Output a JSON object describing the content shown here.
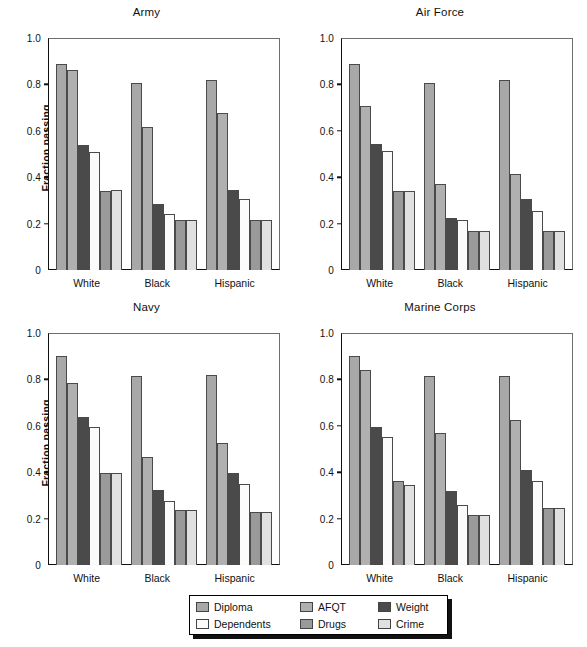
{
  "figure": {
    "ylabel": "Fraction passing",
    "ytick_labels": [
      "1.0",
      "0.8",
      "0.6",
      "0.4",
      "0.2",
      "0"
    ],
    "ytick_values": [
      1.0,
      0.8,
      0.6,
      0.4,
      0.2,
      0
    ],
    "categories": [
      "White",
      "Black",
      "Hispanic"
    ]
  },
  "legend": {
    "items": [
      {
        "label": "Diploma",
        "color": "#a8a8a8"
      },
      {
        "label": "Dependents",
        "color": "#fbfbfb"
      },
      {
        "label": "AFQT",
        "color": "#b0b0b0"
      },
      {
        "label": "Drugs",
        "color": "#9a9a9a"
      },
      {
        "label": "Weight",
        "color": "#4a4a4a"
      },
      {
        "label": "Crime",
        "color": "#e0e0e0"
      }
    ]
  },
  "chart_data": [
    {
      "type": "bar",
      "title": "Army",
      "xlabel": "",
      "ylabel": "Fraction passing",
      "ylim": [
        0,
        1.0
      ],
      "grid": false,
      "legend_position": "bottom-center-shared",
      "categories": [
        "White",
        "Black",
        "Hispanic"
      ],
      "series": [
        {
          "name": "Diploma",
          "color": "#a8a8a8",
          "values": [
            0.89,
            0.805,
            0.82
          ]
        },
        {
          "name": "AFQT",
          "color": "#b0b0b0",
          "values": [
            0.86,
            0.615,
            0.675
          ]
        },
        {
          "name": "Weight",
          "color": "#4a4a4a",
          "values": [
            0.54,
            0.285,
            0.345
          ]
        },
        {
          "name": "Dependents",
          "color": "#fbfbfb",
          "values": [
            0.51,
            0.24,
            0.305
          ]
        },
        {
          "name": "Drugs",
          "color": "#9a9a9a",
          "values": [
            0.34,
            0.215,
            0.215
          ]
        },
        {
          "name": "Crime",
          "color": "#e0e0e0",
          "values": [
            0.345,
            0.215,
            0.215
          ]
        }
      ]
    },
    {
      "type": "bar",
      "title": "Air Force",
      "xlabel": "",
      "ylabel": "",
      "ylim": [
        0,
        1.0
      ],
      "grid": false,
      "legend_position": "bottom-center-shared",
      "categories": [
        "White",
        "Black",
        "Hispanic"
      ],
      "series": [
        {
          "name": "Diploma",
          "color": "#a8a8a8",
          "values": [
            0.89,
            0.805,
            0.82
          ]
        },
        {
          "name": "AFQT",
          "color": "#b0b0b0",
          "values": [
            0.705,
            0.37,
            0.415
          ]
        },
        {
          "name": "Weight",
          "color": "#4a4a4a",
          "values": [
            0.545,
            0.225,
            0.305
          ]
        },
        {
          "name": "Dependents",
          "color": "#fbfbfb",
          "values": [
            0.515,
            0.215,
            0.255
          ]
        },
        {
          "name": "Drugs",
          "color": "#9a9a9a",
          "values": [
            0.34,
            0.17,
            0.17
          ]
        },
        {
          "name": "Crime",
          "color": "#e0e0e0",
          "values": [
            0.34,
            0.17,
            0.17
          ]
        }
      ]
    },
    {
      "type": "bar",
      "title": "Navy",
      "xlabel": "",
      "ylabel": "Fraction passing",
      "ylim": [
        0,
        1.0
      ],
      "grid": false,
      "legend_position": "bottom-center-shared",
      "categories": [
        "White",
        "Black",
        "Hispanic"
      ],
      "series": [
        {
          "name": "Diploma",
          "color": "#a8a8a8",
          "values": [
            0.9,
            0.815,
            0.82
          ]
        },
        {
          "name": "AFQT",
          "color": "#b0b0b0",
          "values": [
            0.785,
            0.465,
            0.525
          ]
        },
        {
          "name": "Weight",
          "color": "#4a4a4a",
          "values": [
            0.64,
            0.325,
            0.395
          ]
        },
        {
          "name": "Dependents",
          "color": "#fbfbfb",
          "values": [
            0.595,
            0.275,
            0.35
          ]
        },
        {
          "name": "Drugs",
          "color": "#9a9a9a",
          "values": [
            0.395,
            0.235,
            0.23
          ]
        },
        {
          "name": "Crime",
          "color": "#e0e0e0",
          "values": [
            0.395,
            0.235,
            0.23
          ]
        }
      ]
    },
    {
      "type": "bar",
      "title": "Marine Corps",
      "xlabel": "",
      "ylabel": "",
      "ylim": [
        0,
        1.0
      ],
      "grid": false,
      "legend_position": "bottom-center-shared",
      "categories": [
        "White",
        "Black",
        "Hispanic"
      ],
      "series": [
        {
          "name": "Diploma",
          "color": "#a8a8a8",
          "values": [
            0.9,
            0.815,
            0.815
          ]
        },
        {
          "name": "AFQT",
          "color": "#b0b0b0",
          "values": [
            0.84,
            0.57,
            0.625
          ]
        },
        {
          "name": "Weight",
          "color": "#4a4a4a",
          "values": [
            0.595,
            0.32,
            0.41
          ]
        },
        {
          "name": "Dependents",
          "color": "#fbfbfb",
          "values": [
            0.55,
            0.26,
            0.36
          ]
        },
        {
          "name": "Drugs",
          "color": "#9a9a9a",
          "values": [
            0.36,
            0.215,
            0.245
          ]
        },
        {
          "name": "Crime",
          "color": "#e0e0e0",
          "values": [
            0.345,
            0.215,
            0.245
          ]
        }
      ]
    }
  ]
}
